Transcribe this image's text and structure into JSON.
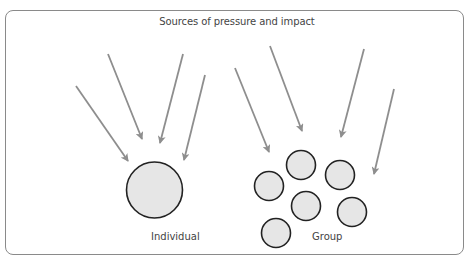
{
  "diagram": {
    "title": "Sources of pressure and impact",
    "labels": {
      "individual": "Individual",
      "group": "Group"
    },
    "colors": {
      "arrow": "#8e8e8e",
      "circle_fill": "#e6e6e6",
      "circle_stroke": "#222222",
      "frame": "#8a8a8a"
    },
    "individual_arrows": [
      {
        "x1": 76,
        "y1": 86,
        "x2": 128,
        "y2": 161
      },
      {
        "x1": 108,
        "y1": 54,
        "x2": 142,
        "y2": 139
      },
      {
        "x1": 183,
        "y1": 54,
        "x2": 160,
        "y2": 143
      },
      {
        "x1": 205,
        "y1": 75,
        "x2": 184,
        "y2": 160
      }
    ],
    "individual_circle": {
      "cx": 154.5,
      "cy": 190,
      "r": 28
    },
    "group_arrows": [
      {
        "x1": 235,
        "y1": 68,
        "x2": 269,
        "y2": 152
      },
      {
        "x1": 270,
        "y1": 46,
        "x2": 302,
        "y2": 131
      },
      {
        "x1": 364,
        "y1": 49,
        "x2": 341,
        "y2": 137
      },
      {
        "x1": 394,
        "y1": 89,
        "x2": 374,
        "y2": 174
      }
    ],
    "group_circles": [
      {
        "cx": 301,
        "cy": 165,
        "r": 14.5
      },
      {
        "cx": 340,
        "cy": 175,
        "r": 14.5
      },
      {
        "cx": 269,
        "cy": 186,
        "r": 14.5
      },
      {
        "cx": 306,
        "cy": 206,
        "r": 14.5
      },
      {
        "cx": 352,
        "cy": 212,
        "r": 14.5
      },
      {
        "cx": 276,
        "cy": 233,
        "r": 14.5
      }
    ]
  }
}
